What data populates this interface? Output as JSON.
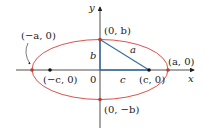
{
  "diagram": {
    "axes": {
      "x_label": "x",
      "y_label": "y"
    },
    "origin_label": "0",
    "points": {
      "neg_a": "(−a, 0)",
      "pos_a": "(a, 0)",
      "neg_c": "(−c, 0)",
      "pos_c": "(c, 0)",
      "pos_b": "(0, b)",
      "neg_b": "(0, −b)"
    },
    "segments": {
      "a": "a",
      "b": "b",
      "c": "c"
    },
    "colors": {
      "ellipse": "#d9534f",
      "triangle": "#3a6ea5",
      "axis": "#222222"
    }
  }
}
